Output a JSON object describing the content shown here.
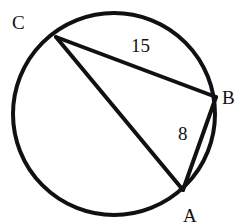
{
  "diagram": {
    "type": "circle-inscribed-triangle",
    "circle": {
      "cx": 114,
      "cy": 114,
      "r": 101
    },
    "points": {
      "C": {
        "label": "C",
        "x": 56,
        "y": 37,
        "lx": 12,
        "ly": 29
      },
      "B": {
        "label": "B",
        "x": 216,
        "y": 97,
        "lx": 222,
        "ly": 104
      },
      "A": {
        "label": "A",
        "x": 183,
        "y": 190,
        "lx": 183,
        "ly": 222
      }
    },
    "segments": [
      {
        "from": "C",
        "to": "B",
        "length_label": "15",
        "lx": 131,
        "ly": 52
      },
      {
        "from": "B",
        "to": "A",
        "length_label": "8",
        "lx": 178,
        "ly": 140
      },
      {
        "from": "C",
        "to": "A",
        "length_label": ""
      }
    ],
    "stroke_color": "#111111"
  }
}
